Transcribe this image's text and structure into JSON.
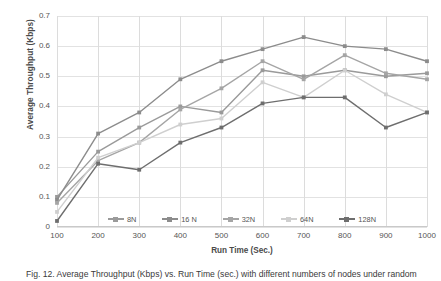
{
  "chart_data": {
    "type": "line",
    "title": "",
    "xlabel": "Run Time (Sec.)",
    "ylabel": "Average Throughput (Kbps)",
    "x": [
      100,
      200,
      300,
      400,
      500,
      600,
      700,
      800,
      900,
      1000
    ],
    "xticklabels": [
      "100",
      "200",
      "300",
      "400",
      "500",
      "600",
      "700",
      "800",
      "900",
      "1000"
    ],
    "yticklabels": [
      "0.7",
      "0.6",
      "0.5",
      "0.4",
      "0.3",
      "0.2",
      "0.1",
      "0"
    ],
    "ylim": [
      0,
      0.7
    ],
    "xlim": [
      100,
      1000
    ],
    "grid": "both",
    "legend_position": "inside-bottom-center",
    "series": [
      {
        "name": "8N",
        "color": "#9a9a9a",
        "values": [
          0.1,
          0.25,
          0.33,
          0.4,
          0.38,
          0.52,
          0.5,
          0.52,
          0.5,
          0.51
        ]
      },
      {
        "name": "16 N",
        "color": "#8c8c8c",
        "values": [
          0.09,
          0.31,
          0.38,
          0.49,
          0.55,
          0.59,
          0.63,
          0.6,
          0.59,
          0.55
        ]
      },
      {
        "name": "32N",
        "color": "#a5a5a5",
        "values": [
          0.08,
          0.22,
          0.28,
          0.39,
          0.46,
          0.55,
          0.49,
          0.57,
          0.51,
          0.49
        ]
      },
      {
        "name": "64N",
        "color": "#cfcfcf",
        "values": [
          0.05,
          0.23,
          0.28,
          0.34,
          0.36,
          0.48,
          0.43,
          0.52,
          0.44,
          0.38
        ]
      },
      {
        "name": "128N",
        "color": "#6e6e6e",
        "values": [
          0.02,
          0.21,
          0.19,
          0.28,
          0.33,
          0.41,
          0.43,
          0.43,
          0.33,
          0.38
        ]
      }
    ]
  },
  "caption": {
    "text": "Fig. 12.  Average Throughput (Kbps) vs. Run Time (sec.) with different numbers of nodes under random"
  }
}
